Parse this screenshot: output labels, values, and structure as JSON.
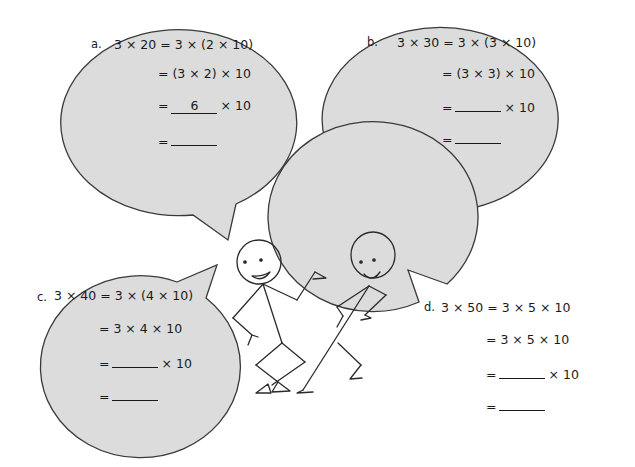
{
  "worksheet": {
    "problems": [
      {
        "label": "a.",
        "line1": "3 × 20 = 3 × (2 × 10)",
        "line2": "= (3 × 2) × 10",
        "line3_prefix": "=",
        "line3_blank": "6",
        "line3_suffix": "× 10",
        "line4_prefix": "=",
        "line4_blank": ""
      },
      {
        "label": "b.",
        "line1": "3 × 30 = 3 × (3 × 10)",
        "line2": "= (3 × 3) × 10",
        "line3_prefix": "=",
        "line3_blank": "",
        "line3_suffix": "× 10",
        "line4_prefix": "=",
        "line4_blank": ""
      },
      {
        "label": "c.",
        "line1": "3 × 40 = 3 × (4 × 10)",
        "line2": "= 3 × 4 × 10",
        "line3_prefix": "=",
        "line3_blank": "",
        "line3_suffix": "× 10",
        "line4_prefix": "=",
        "line4_blank": ""
      },
      {
        "label": "d.",
        "line1": "3 × 50 = 3 × 5 × 10",
        "line2": "= 3 × 5 × 10",
        "line3_prefix": "=",
        "line3_blank": "",
        "line3_suffix": "× 10",
        "line4_prefix": "=",
        "line4_blank": ""
      }
    ],
    "colors": {
      "bubble_fill": "#dcdcdc",
      "bubble_stroke": "#3a3a3a",
      "text": "#1a1a1a"
    }
  }
}
